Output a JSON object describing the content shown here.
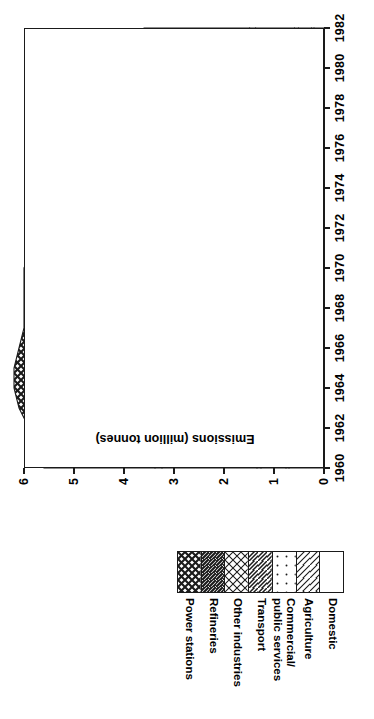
{
  "chart_data": {
    "type": "area",
    "title": "",
    "xlabel": "",
    "ylabel": "Emissions (million tonnes)",
    "xlim": [
      1960,
      1982
    ],
    "ylim": [
      0,
      6
    ],
    "grid": false,
    "orientation": "rotated-90ccw",
    "legend_position": "below",
    "xticks": [
      1960,
      1962,
      1964,
      1966,
      1968,
      1970,
      1972,
      1974,
      1976,
      1978,
      1980,
      1982
    ],
    "yticks": [
      0,
      1,
      2,
      3,
      4,
      5,
      6
    ],
    "x": [
      1960,
      1961,
      1962,
      1963,
      1964,
      1965,
      1966,
      1967,
      1968,
      1969,
      1970,
      1971,
      1972,
      1973,
      1974,
      1975,
      1976,
      1977,
      1978,
      1979,
      1980,
      1981,
      1982
    ],
    "stacking": "bottom-to-top: Domestic, Agriculture, Commercial/public services, Transport, Other industries, Refineries, Power stations",
    "series": [
      {
        "name": "Domestic",
        "values": [
          0.7,
          0.68,
          0.66,
          0.64,
          0.62,
          0.58,
          0.54,
          0.5,
          0.46,
          0.42,
          0.38,
          0.34,
          0.32,
          0.3,
          0.28,
          0.26,
          0.25,
          0.24,
          0.23,
          0.22,
          0.21,
          0.2,
          0.2
        ]
      },
      {
        "name": "Agriculture",
        "values": [
          0.06,
          0.06,
          0.06,
          0.06,
          0.06,
          0.06,
          0.06,
          0.06,
          0.06,
          0.06,
          0.06,
          0.06,
          0.06,
          0.06,
          0.05,
          0.05,
          0.05,
          0.05,
          0.05,
          0.05,
          0.05,
          0.05,
          0.05
        ]
      },
      {
        "name": "Commercial/ public services",
        "values": [
          0.5,
          0.5,
          0.5,
          0.5,
          0.5,
          0.5,
          0.5,
          0.5,
          0.48,
          0.46,
          0.44,
          0.4,
          0.36,
          0.34,
          0.33,
          0.32,
          0.31,
          0.3,
          0.3,
          0.29,
          0.28,
          0.27,
          0.26
        ]
      },
      {
        "name": "Transport",
        "values": [
          0.08,
          0.08,
          0.08,
          0.08,
          0.08,
          0.08,
          0.08,
          0.08,
          0.08,
          0.08,
          0.08,
          0.08,
          0.08,
          0.08,
          0.08,
          0.08,
          0.08,
          0.08,
          0.08,
          0.08,
          0.08,
          0.08,
          0.08
        ]
      },
      {
        "name": "Other industries",
        "values": [
          1.9,
          1.92,
          1.94,
          1.96,
          1.98,
          1.96,
          1.94,
          1.9,
          1.86,
          1.82,
          1.78,
          1.7,
          1.6,
          1.56,
          1.46,
          1.32,
          1.24,
          1.18,
          1.12,
          1.06,
          0.92,
          0.82,
          0.78
        ]
      },
      {
        "name": "Refineries",
        "values": [
          0.14,
          0.15,
          0.16,
          0.17,
          0.18,
          0.19,
          0.2,
          0.21,
          0.22,
          0.23,
          0.24,
          0.24,
          0.24,
          0.24,
          0.23,
          0.21,
          0.2,
          0.19,
          0.18,
          0.17,
          0.15,
          0.13,
          0.12
        ]
      },
      {
        "name": "Power stations",
        "values": [
          2.22,
          2.31,
          2.5,
          2.69,
          2.78,
          2.83,
          2.78,
          2.75,
          2.84,
          2.93,
          3.02,
          2.98,
          2.94,
          3.02,
          2.77,
          2.66,
          2.67,
          2.66,
          2.64,
          2.73,
          2.41,
          2.25,
          2.11
        ]
      }
    ],
    "totals": [
      5.6,
      5.7,
      5.9,
      6.1,
      6.2,
      6.2,
      6.1,
      6.0,
      6.0,
      6.0,
      6.0,
      5.8,
      5.6,
      5.6,
      5.2,
      4.9,
      4.8,
      4.7,
      4.6,
      4.6,
      4.1,
      3.8,
      3.6
    ]
  },
  "axes": {
    "y_title": "Emissions (million tonnes)",
    "y_tick_labels": [
      "0",
      "1",
      "2",
      "3",
      "4",
      "5",
      "6"
    ],
    "x_tick_labels": [
      "1960",
      "1962",
      "1964",
      "1966",
      "1968",
      "1970",
      "1972",
      "1974",
      "1976",
      "1978",
      "1980",
      "1982"
    ]
  },
  "legend": {
    "items": [
      {
        "label": "Power stations",
        "pattern": "dense-crosshatch",
        "lines": [
          "Power stations"
        ]
      },
      {
        "label": "Refineries",
        "pattern": "dense-diagonal",
        "lines": [
          "Refineries"
        ]
      },
      {
        "label": "Other industries",
        "pattern": "medium-crosshatch",
        "lines": [
          "Other industries"
        ]
      },
      {
        "label": "Transport",
        "pattern": "medium-diagonal",
        "lines": [
          "Transport"
        ]
      },
      {
        "label": "Commercial/ public services",
        "pattern": "dots",
        "lines": [
          "Commercial/",
          "public services"
        ]
      },
      {
        "label": "Agriculture",
        "pattern": "sparse-diagonal",
        "lines": [
          "Agriculture"
        ]
      },
      {
        "label": "Domestic",
        "pattern": "blank",
        "lines": [
          "Domestic"
        ]
      }
    ]
  },
  "colors": {
    "ink": "#1a1a1a",
    "background": "#ffffff"
  }
}
